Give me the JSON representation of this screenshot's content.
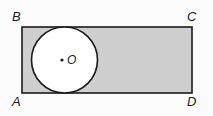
{
  "figure": {
    "type": "geometry-diagram",
    "background_color": "#fcfcfc",
    "rectangle": {
      "name": "rectangle-ABCD",
      "fill_color": "#cfcfcf",
      "stroke_color": "#1a1a1a",
      "stroke_width": 1.6,
      "x": 22,
      "y": 27,
      "width": 170,
      "height": 66,
      "vertices": [
        {
          "id": "B",
          "label": "B",
          "position": "top-left"
        },
        {
          "id": "C",
          "label": "C",
          "position": "top-right"
        },
        {
          "id": "A",
          "label": "A",
          "position": "bottom-left"
        },
        {
          "id": "D",
          "label": "D",
          "position": "bottom-right"
        }
      ]
    },
    "circle": {
      "name": "inscribed-circle",
      "label": "O",
      "fill_color": "#ffffff",
      "stroke_color": "#1a1a1a",
      "stroke_width": 1.6,
      "center_x": 64.5,
      "center_y": 60,
      "radius": 33,
      "center_dot_radius": 1.6,
      "center_dot_color": "#1a1a1a"
    }
  }
}
